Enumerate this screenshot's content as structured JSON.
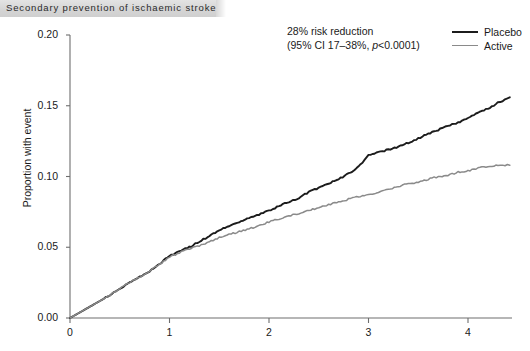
{
  "header": {
    "title": "Secondary prevention of ischaemic stroke"
  },
  "annotation": {
    "line1": "28% risk reduction",
    "line2_prefix": "(95% CI 17–38%, ",
    "line2_italic": "p",
    "line2_suffix": "<0.0001)"
  },
  "legend": {
    "position": "top-right",
    "items": [
      {
        "label": "Placebo",
        "color": "#1c1c1c"
      },
      {
        "label": "Active",
        "color": "#8a8a8a"
      }
    ]
  },
  "axes": {
    "y": {
      "label": "Proportion with event",
      "ticks": [
        "0.00",
        "0.05",
        "0.10",
        "0.15",
        "0.20"
      ],
      "tick_values": [
        0.0,
        0.05,
        0.1,
        0.15,
        0.2
      ],
      "min": 0.0,
      "max": 0.2
    },
    "x": {
      "label": "",
      "ticks": [
        "0",
        "1",
        "2",
        "3",
        "4"
      ],
      "tick_values": [
        0,
        1,
        2,
        3,
        4
      ],
      "min": 0,
      "max": 4.42
    }
  },
  "chart_data": {
    "type": "line",
    "title": "Secondary prevention of ischaemic stroke",
    "xlabel": "",
    "ylabel": "Proportion with event",
    "xlim": [
      0,
      4.42
    ],
    "ylim": [
      0,
      0.2
    ],
    "grid": false,
    "legend_position": "top-right",
    "annotations": [
      "28% risk reduction",
      "(95% CI 17–38%, p<0.0001)"
    ],
    "series": [
      {
        "name": "Placebo",
        "color": "#1c1c1c",
        "x": [
          0.0,
          0.1,
          0.2,
          0.3,
          0.4,
          0.5,
          0.6,
          0.7,
          0.8,
          0.9,
          1.0,
          1.1,
          1.2,
          1.3,
          1.4,
          1.5,
          1.6,
          1.7,
          1.8,
          1.9,
          2.0,
          2.1,
          2.2,
          2.3,
          2.4,
          2.5,
          2.6,
          2.7,
          2.8,
          2.9,
          3.0,
          3.1,
          3.2,
          3.3,
          3.4,
          3.5,
          3.6,
          3.7,
          3.8,
          3.9,
          4.0,
          4.1,
          4.2,
          4.3,
          4.42
        ],
        "y": [
          0.0,
          0.004,
          0.008,
          0.012,
          0.016,
          0.021,
          0.025,
          0.029,
          0.033,
          0.038,
          0.044,
          0.047,
          0.05,
          0.054,
          0.058,
          0.062,
          0.065,
          0.068,
          0.071,
          0.073,
          0.076,
          0.079,
          0.082,
          0.085,
          0.089,
          0.092,
          0.095,
          0.098,
          0.102,
          0.107,
          0.115,
          0.117,
          0.119,
          0.121,
          0.124,
          0.127,
          0.13,
          0.133,
          0.136,
          0.138,
          0.141,
          0.145,
          0.148,
          0.152,
          0.156
        ]
      },
      {
        "name": "Active",
        "color": "#8a8a8a",
        "x": [
          0.0,
          0.1,
          0.2,
          0.3,
          0.4,
          0.5,
          0.6,
          0.7,
          0.8,
          0.9,
          1.0,
          1.1,
          1.2,
          1.3,
          1.4,
          1.5,
          1.6,
          1.7,
          1.8,
          1.9,
          2.0,
          2.1,
          2.2,
          2.3,
          2.4,
          2.5,
          2.6,
          2.7,
          2.8,
          2.9,
          3.0,
          3.1,
          3.2,
          3.3,
          3.4,
          3.5,
          3.6,
          3.7,
          3.8,
          3.9,
          4.0,
          4.1,
          4.2,
          4.3,
          4.42
        ],
        "y": [
          0.0,
          0.004,
          0.008,
          0.012,
          0.016,
          0.021,
          0.025,
          0.029,
          0.033,
          0.038,
          0.043,
          0.046,
          0.049,
          0.051,
          0.054,
          0.057,
          0.059,
          0.061,
          0.063,
          0.065,
          0.068,
          0.07,
          0.072,
          0.074,
          0.076,
          0.078,
          0.08,
          0.082,
          0.084,
          0.086,
          0.087,
          0.089,
          0.091,
          0.093,
          0.095,
          0.096,
          0.098,
          0.1,
          0.101,
          0.103,
          0.104,
          0.106,
          0.107,
          0.108,
          0.108
        ]
      }
    ]
  }
}
